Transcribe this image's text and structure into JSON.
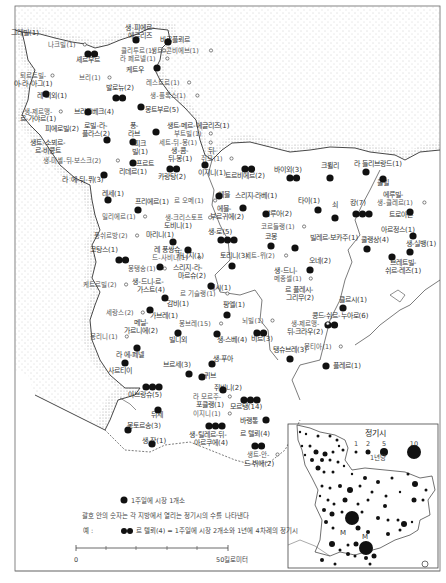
{
  "map": {
    "title": "",
    "sea_pattern": "dotted",
    "markets": [
      {
        "name": "그레빌(1)",
        "x": 25,
        "y": 35,
        "dots": 0,
        "small": false
      },
      {
        "name": "나크빌(1)",
        "x": 62,
        "y": 47,
        "dots": 0,
        "small": true
      },
      {
        "name": "생-피에르-",
        "x": 140,
        "y": 30,
        "dots": 0,
        "small": false
      },
      {
        "name": "에글리즈",
        "x": 140,
        "y": 38,
        "dots": 1,
        "dx": 136,
        "dy": 40
      },
      {
        "name": "바르플뢰르",
        "x": 175,
        "y": 42,
        "dots": 1,
        "dx": 168,
        "dy": 42
      },
      {
        "name": "클리투르(1)",
        "x": 138,
        "y": 53,
        "dots": 0,
        "small": true
      },
      {
        "name": "생트-콘비에브(1)",
        "x": 175,
        "y": 53,
        "dots": 0,
        "small": true
      },
      {
        "name": "라 페르넬(1)",
        "x": 138,
        "y": 61,
        "dots": 0,
        "small": true
      },
      {
        "name": "셰르부르",
        "x": 88,
        "y": 62,
        "dots": 2,
        "dx": 88,
        "dy": 54
      },
      {
        "name": "케트우",
        "x": 135,
        "y": 72,
        "dots": 1,
        "dx": 157,
        "dy": 68
      },
      {
        "name": "레스트르(1)",
        "x": 163,
        "y": 85,
        "dots": 0,
        "small": true
      },
      {
        "name": "퇴르트빌-",
        "x": 33,
        "y": 78,
        "dots": 0,
        "small": true
      },
      {
        "name": "아-라-아그(1)",
        "x": 33,
        "y": 86,
        "dots": 0,
        "small": false
      },
      {
        "name": "브리(1)",
        "x": 90,
        "y": 80,
        "dots": 0,
        "small": true
      },
      {
        "name": "발로뉴(2)",
        "x": 120,
        "y": 90,
        "dots": 2,
        "dx": 116,
        "dy": 98
      },
      {
        "name": "생-플록스(1)",
        "x": 168,
        "y": 98,
        "dots": 0,
        "small": true
      },
      {
        "name": "레 피외(1)",
        "x": 52,
        "y": 98,
        "dots": 1,
        "dx": 46,
        "dy": 94
      },
      {
        "name": "몽트부르(5)",
        "x": 162,
        "y": 112,
        "dots": 1,
        "dx": 141,
        "dy": 107
      },
      {
        "name": "브리크베크(4)",
        "x": 94,
        "y": 114,
        "dots": 1,
        "dx": 88,
        "dy": 112
      },
      {
        "name": "생-제르맹-",
        "x": 38,
        "y": 114,
        "dots": 0,
        "small": true
      },
      {
        "name": "르-가야르(1)",
        "x": 38,
        "y": 121,
        "dots": 0,
        "small": false
      },
      {
        "name": "로빌-라-",
        "x": 96,
        "y": 128,
        "dots": 0,
        "small": false
      },
      {
        "name": "플라스(2)",
        "x": 96,
        "y": 136,
        "dots": 0,
        "small": false
      },
      {
        "name": "퐁-",
        "x": 134,
        "y": 128,
        "dots": 0,
        "small": false
      },
      {
        "name": "라브",
        "x": 134,
        "y": 136,
        "dots": 1,
        "dx": 133,
        "dy": 142
      },
      {
        "name": "생트-메르-에글리즈(1)",
        "x": 198,
        "y": 128,
        "dots": 1,
        "dx": 156,
        "dy": 132
      },
      {
        "name": "부트빌(1)",
        "x": 188,
        "y": 136,
        "dots": 0,
        "small": true
      },
      {
        "name": "피에로빌(2)",
        "x": 62,
        "y": 131,
        "dots": 0,
        "small": false
      },
      {
        "name": "생트-소뵈르-",
        "x": 48,
        "y": 145,
        "dots": 0,
        "small": false
      },
      {
        "name": "르-비콩트",
        "x": 48,
        "y": 153,
        "dots": 1,
        "dx": 107,
        "dy": 140
      },
      {
        "name": "피크",
        "x": 140,
        "y": 146,
        "dots": 0,
        "small": false
      },
      {
        "name": "빌(1)",
        "x": 140,
        "y": 154,
        "dots": 0,
        "small": false
      },
      {
        "name": "세트-뒤-몽(1)",
        "x": 178,
        "y": 145,
        "dots": 0,
        "small": true
      },
      {
        "name": "생-콤-",
        "x": 180,
        "y": 153,
        "dots": 0,
        "small": false
      },
      {
        "name": "뒤-몽(1)",
        "x": 180,
        "y": 161,
        "dots": 0,
        "small": false
      },
      {
        "name": "생-미셸-뒤-보스크(2)",
        "x": 72,
        "y": 163,
        "dots": 0,
        "small": true
      },
      {
        "name": "프르트",
        "x": 145,
        "y": 166,
        "dots": 1,
        "dx": 133,
        "dy": 163
      },
      {
        "name": "리데르(1)",
        "x": 133,
        "y": 174,
        "dots": 0,
        "small": false
      },
      {
        "name": "라 에-뒤-퓌(3)",
        "x": 83,
        "y": 182,
        "dots": 1,
        "dx": 104,
        "dy": 175
      },
      {
        "name": "카랑탕(2)",
        "x": 172,
        "y": 179,
        "dots": 2,
        "dx": 170,
        "dy": 169
      },
      {
        "name": "뒤-",
        "x": 212,
        "y": 153,
        "dots": 0,
        "small": false
      },
      {
        "name": "쥐모(1)",
        "x": 212,
        "y": 161,
        "dots": 0,
        "small": true
      },
      {
        "name": "이지니(1)",
        "x": 212,
        "y": 175,
        "dots": 1,
        "dx": 205,
        "dy": 165
      },
      {
        "name": "트르비에르(2)",
        "x": 245,
        "y": 178,
        "dots": 2,
        "dx": 245,
        "dy": 169
      },
      {
        "name": "바이외(3)",
        "x": 288,
        "y": 172,
        "dots": 2,
        "dx": 290,
        "dy": 178
      },
      {
        "name": "크륄리",
        "x": 330,
        "y": 168,
        "dots": 1,
        "dx": 330,
        "dy": 178
      },
      {
        "name": "라 들리브랑드(1)",
        "x": 378,
        "y": 166,
        "dots": 1,
        "dx": 366,
        "dy": 172
      },
      {
        "name": "쿨빌",
        "x": 383,
        "y": 185,
        "dots": 1,
        "dx": 383,
        "dy": 179
      },
      {
        "name": "에루빌-",
        "x": 393,
        "y": 197,
        "dots": 0,
        "small": false
      },
      {
        "name": "생-클레르(1)",
        "x": 395,
        "y": 205,
        "dots": 0,
        "small": true
      },
      {
        "name": "레세(1)",
        "x": 113,
        "y": 196,
        "dots": 1,
        "dx": 108,
        "dy": 200
      },
      {
        "name": "프리에르(1)",
        "x": 152,
        "y": 204,
        "dots": 1,
        "dx": 138,
        "dy": 210
      },
      {
        "name": "르 오메(1)",
        "x": 189,
        "y": 203,
        "dots": 0,
        "small": true
      },
      {
        "name": "에블",
        "x": 224,
        "y": 197,
        "dots": 1,
        "dx": 219,
        "dy": 196
      },
      {
        "name": "에블-",
        "x": 224,
        "y": 211,
        "dots": 0,
        "small": false
      },
      {
        "name": "부르귀에(2)",
        "x": 227,
        "y": 219,
        "dots": 0,
        "small": false
      },
      {
        "name": "스리지-라베(1)",
        "x": 256,
        "y": 198,
        "dots": 1,
        "dx": 243,
        "dy": 208
      },
      {
        "name": "타이(1)",
        "x": 309,
        "y": 203,
        "dots": 1,
        "dx": 318,
        "dy": 210
      },
      {
        "name": "쇠",
        "x": 335,
        "y": 207,
        "dots": 1,
        "dx": 335,
        "dy": 218
      },
      {
        "name": "캉(7)",
        "x": 358,
        "y": 205,
        "dots": 3,
        "dx": 356,
        "dy": 214
      },
      {
        "name": "트로아른",
        "x": 401,
        "y": 217,
        "dots": 1,
        "dx": 410,
        "dy": 212
      },
      {
        "name": "밀리에르(1)",
        "x": 119,
        "y": 219,
        "dots": 0,
        "small": true
      },
      {
        "name": "생-크리스토프",
        "x": 184,
        "y": 220,
        "dots": 0,
        "small": true
      },
      {
        "name": "도비니(1)",
        "x": 178,
        "y": 228,
        "dots": 0,
        "small": false
      },
      {
        "name": "발루아(2)",
        "x": 278,
        "y": 216,
        "dots": 1,
        "dx": 266,
        "dy": 214
      },
      {
        "name": "코르들랭(1)",
        "x": 278,
        "y": 229,
        "dots": 0,
        "small": true
      },
      {
        "name": "아르정스(1)",
        "x": 398,
        "y": 232,
        "dots": 1,
        "dx": 413,
        "dy": 236
      },
      {
        "name": "퐁쉬르방(2)",
        "x": 111,
        "y": 238,
        "dots": 0,
        "small": true
      },
      {
        "name": "마리니(1)",
        "x": 160,
        "y": 237,
        "dots": 1,
        "dx": 173,
        "dy": 242
      },
      {
        "name": "생-로(5)",
        "x": 220,
        "y": 234,
        "dots": 3,
        "dx": 221,
        "dy": 240
      },
      {
        "name": "코몽",
        "x": 271,
        "y": 239,
        "dots": 1,
        "dx": 271,
        "dy": 246
      },
      {
        "name": "빌레르-보카주(1)",
        "x": 334,
        "y": 240,
        "dots": 1,
        "dx": 295,
        "dy": 248
      },
      {
        "name": "쿨랭상(4)",
        "x": 375,
        "y": 242,
        "dots": 1,
        "dx": 367,
        "dy": 249
      },
      {
        "name": "생-실뱅(1)",
        "x": 421,
        "y": 246,
        "dots": 1,
        "dx": 410,
        "dy": 252
      },
      {
        "name": "레 퐁쌍슈-",
        "x": 168,
        "y": 252,
        "dots": 0,
        "small": false
      },
      {
        "name": "드-사비니(1)",
        "x": 170,
        "y": 260,
        "dots": 0,
        "small": true
      },
      {
        "name": "카니지(1)",
        "x": 190,
        "y": 258,
        "dots": 1,
        "dx": 188,
        "dy": 250
      },
      {
        "name": "코탕스(1)",
        "x": 104,
        "y": 252,
        "dots": 2,
        "dx": 119,
        "dy": 260
      },
      {
        "name": "세트-뮈(2)",
        "x": 260,
        "y": 258,
        "dots": 0,
        "small": true
      },
      {
        "name": "토리니(3)",
        "x": 234,
        "y": 258,
        "dots": 1,
        "dx": 232,
        "dy": 266
      },
      {
        "name": "오네(2)",
        "x": 320,
        "y": 263,
        "dots": 1,
        "dx": 310,
        "dy": 270
      },
      {
        "name": "브레트빌-",
        "x": 403,
        "y": 265,
        "dots": 1,
        "dx": 392,
        "dy": 257
      },
      {
        "name": "쉬르-레즈(1)",
        "x": 403,
        "y": 273,
        "dots": 0,
        "small": false
      },
      {
        "name": "몽탱송(1)",
        "x": 142,
        "y": 271,
        "dots": 0,
        "small": true
      },
      {
        "name": "스리지-라-",
        "x": 188,
        "y": 270,
        "dots": 1,
        "dx": 160,
        "dy": 267
      },
      {
        "name": "마르슈(2)",
        "x": 192,
        "y": 278,
        "dots": 0,
        "small": false
      },
      {
        "name": "생-드니-",
        "x": 286,
        "y": 273,
        "dots": 0,
        "small": false
      },
      {
        "name": "메종셀(1)",
        "x": 288,
        "y": 281,
        "dots": 0,
        "small": true
      },
      {
        "name": "생-드니-르-",
        "x": 148,
        "y": 284,
        "dots": 0,
        "small": false
      },
      {
        "name": "가스트(4)",
        "x": 151,
        "y": 292,
        "dots": 0,
        "small": false
      },
      {
        "name": "케트르빌(2)",
        "x": 100,
        "y": 287,
        "dots": 0,
        "small": true
      },
      {
        "name": "테시(1)",
        "x": 220,
        "y": 290,
        "dots": 1,
        "dx": 211,
        "dy": 286
      },
      {
        "name": "르 플레시-",
        "x": 299,
        "y": 292,
        "dots": 0,
        "small": false
      },
      {
        "name": "그리무(2)",
        "x": 300,
        "y": 300,
        "dots": 0,
        "small": false
      },
      {
        "name": "르 기슬랭(1)",
        "x": 198,
        "y": 296,
        "dots": 0,
        "small": true
      },
      {
        "name": "클르시(1)",
        "x": 353,
        "y": 302,
        "dots": 1,
        "dx": 343,
        "dy": 308
      },
      {
        "name": "감비(1)",
        "x": 178,
        "y": 306,
        "dots": 1,
        "dx": 165,
        "dy": 298
      },
      {
        "name": "세랑스(2)",
        "x": 120,
        "y": 315,
        "dots": 0,
        "small": true
      },
      {
        "name": "가브레(1)",
        "x": 164,
        "y": 318,
        "dots": 1,
        "dx": 150,
        "dy": 310
      },
      {
        "name": "팡엘(1)",
        "x": 234,
        "y": 307,
        "dots": 1,
        "dx": 227,
        "dy": 315
      },
      {
        "name": "콩드-쉬르-누아로(6)",
        "x": 340,
        "y": 318,
        "dots": 2,
        "dx": 328,
        "dy": 325
      },
      {
        "name": "생-제르맹-",
        "x": 305,
        "y": 326,
        "dots": 0,
        "small": true
      },
      {
        "name": "뒤-크라우(2)",
        "x": 305,
        "y": 334,
        "dots": 0,
        "small": false
      },
      {
        "name": "메닐-",
        "x": 141,
        "y": 325,
        "dots": 0,
        "small": false
      },
      {
        "name": "가르니에(2)",
        "x": 141,
        "y": 333,
        "dots": 0,
        "small": false
      },
      {
        "name": "몽브레(15)",
        "x": 195,
        "y": 326,
        "dots": 0,
        "small": true
      },
      {
        "name": "뇌빌(1)",
        "x": 253,
        "y": 323,
        "dots": 0,
        "small": true
      },
      {
        "name": "몽리니(1)",
        "x": 104,
        "y": 339,
        "dots": 0,
        "small": true
      },
      {
        "name": "빌디외",
        "x": 178,
        "y": 342,
        "dots": 1,
        "dx": 178,
        "dy": 333
      },
      {
        "name": "생-스베(4)",
        "x": 232,
        "y": 342,
        "dots": 1,
        "dx": 217,
        "dy": 334
      },
      {
        "name": "비르(3)",
        "x": 262,
        "y": 341,
        "dots": 2,
        "dx": 257,
        "dy": 333
      },
      {
        "name": "몽티아(1)",
        "x": 318,
        "y": 349,
        "dots": 0,
        "small": true
      },
      {
        "name": "탱슈브레(3)",
        "x": 290,
        "y": 352,
        "dots": 1,
        "dx": 290,
        "dy": 359
      },
      {
        "name": "라 에-페넬",
        "x": 130,
        "y": 357,
        "dots": 1,
        "dx": 137,
        "dy": 348
      },
      {
        "name": "생-푸아",
        "x": 223,
        "y": 361,
        "dots": 1,
        "dx": 212,
        "dy": 364
      },
      {
        "name": "플레르(1)",
        "x": 347,
        "y": 368,
        "dots": 1,
        "dx": 326,
        "dy": 366
      },
      {
        "name": "브르세(3)",
        "x": 177,
        "y": 367,
        "dots": 1,
        "dx": 189,
        "dy": 374
      },
      {
        "name": "사르티이",
        "x": 120,
        "y": 373,
        "dots": 1,
        "dx": 125,
        "dy": 363
      },
      {
        "name": "퀴브",
        "x": 210,
        "y": 378,
        "dots": 1,
        "dx": 202,
        "dy": 377
      },
      {
        "name": "쥐비니(2)",
        "x": 228,
        "y": 390,
        "dots": 1,
        "dx": 223,
        "dy": 390
      },
      {
        "name": "아브랑슈(5)",
        "x": 145,
        "y": 397,
        "dots": 3,
        "dx": 146,
        "dy": 387
      },
      {
        "name": "라 모르주-",
        "x": 207,
        "y": 399,
        "dots": 0,
        "small": true
      },
      {
        "name": "포클랭(1)",
        "x": 210,
        "y": 407,
        "dots": 0,
        "small": false
      },
      {
        "name": "모르탱(14)",
        "x": 246,
        "y": 409,
        "dots": 3,
        "dx": 244,
        "dy": 400
      },
      {
        "name": "뒤세",
        "x": 157,
        "y": 417,
        "dots": 1,
        "dx": 158,
        "dy": 410
      },
      {
        "name": "이지니(1)",
        "x": 207,
        "y": 416,
        "dots": 0,
        "small": true
      },
      {
        "name": "바랭통",
        "x": 249,
        "y": 423,
        "dots": 1,
        "dx": 266,
        "dy": 420
      },
      {
        "name": "생-틸레르-뒤-",
        "x": 208,
        "y": 437,
        "dots": 3,
        "dx": 209,
        "dy": 426
      },
      {
        "name": "아르쿠에(4)",
        "x": 211,
        "y": 445,
        "dots": 0,
        "small": false
      },
      {
        "name": "르 텔뢰(4)",
        "x": 255,
        "y": 436,
        "dots": 2,
        "dx": 255,
        "dy": 446
      },
      {
        "name": "몽토르송(3)",
        "x": 144,
        "y": 428,
        "dots": 1,
        "dx": 128,
        "dy": 430
      },
      {
        "name": "생-장(1)",
        "x": 154,
        "y": 443,
        "dots": 1,
        "dx": 152,
        "dy": 444
      },
      {
        "name": "생트-안-",
        "x": 258,
        "y": 457,
        "dots": 0,
        "small": true
      },
      {
        "name": "드-뷔에(2)",
        "x": 259,
        "y": 466,
        "dots": 0,
        "small": false
      }
    ]
  },
  "inset": {
    "title": "정기시",
    "sizes": [
      {
        "label": "1",
        "r": 1.5
      },
      {
        "label": "2",
        "r": 2.5
      },
      {
        "label": "5",
        "r": 4
      },
      {
        "label": "10",
        "r": 7
      }
    ],
    "unit": "1년당",
    "markers": [
      "M",
      "M"
    ]
  },
  "legend": {
    "dot_label": "1주일에 시장 1개소",
    "note": "괄호 안의 숫자는 각 지방에서 열리는 정기시의 수를 나타낸다",
    "example_prefix": "예 :",
    "example_text": "르 텔뢰(4) = 1주일에 시장 2개소와 1년에 4차례의 정기시"
  },
  "scale": {
    "start": "0",
    "end": "50킬로미터"
  },
  "colors": {
    "dot": "#111111",
    "line": "#333333",
    "text": "#333333",
    "sea_dot": "#888888"
  }
}
